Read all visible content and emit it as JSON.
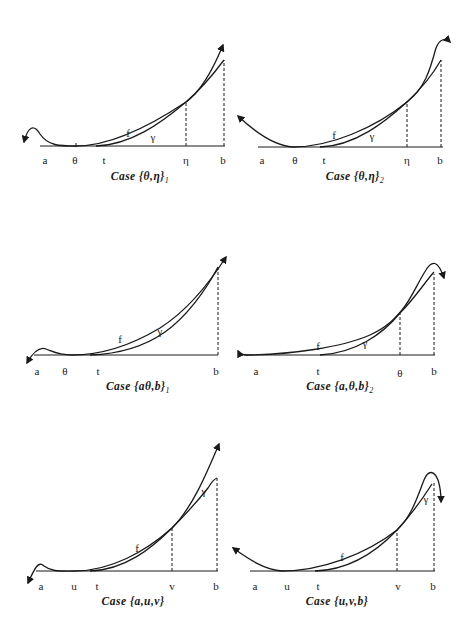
{
  "figure": {
    "panels": [
      {
        "id": "theta-eta-1",
        "caption": "Case {θ,η}",
        "caption_subscript": "1",
        "axis_labels": [
          "a",
          "θ",
          "t",
          "η",
          "b"
        ],
        "curve_labels": {
          "f": "f",
          "gamma": "γ"
        }
      },
      {
        "id": "theta-eta-2",
        "caption": "Case {θ,η}",
        "caption_subscript": "2",
        "axis_labels": [
          "a",
          "θ",
          "t",
          "η",
          "b"
        ],
        "curve_labels": {
          "f": "f",
          "gamma": "γ"
        }
      },
      {
        "id": "a-theta-b-1",
        "caption": "Case {aθ,b}",
        "caption_subscript": "1",
        "axis_labels": [
          "a",
          "θ",
          "t",
          "b"
        ],
        "curve_labels": {
          "f": "f",
          "gamma": "γ"
        }
      },
      {
        "id": "a-theta-b-2",
        "caption": "Case {a,θ,b}",
        "caption_subscript": "2",
        "axis_labels": [
          "a",
          "t",
          "θ",
          "b"
        ],
        "curve_labels": {
          "f": "f",
          "gamma": "γ"
        }
      },
      {
        "id": "a-u-v",
        "caption": "Case {a,u,v}",
        "caption_subscript": "",
        "axis_labels": [
          "a",
          "u",
          "t",
          "v",
          "b"
        ],
        "curve_labels": {
          "f": "f",
          "gamma": "γ"
        }
      },
      {
        "id": "u-v-b",
        "caption": "Case {u,v,b}",
        "caption_subscript": "",
        "axis_labels": [
          "a",
          "u",
          "t",
          "v",
          "b"
        ],
        "curve_labels": {
          "f": "f",
          "gamma": "γ"
        }
      }
    ]
  },
  "colors": {
    "ink": "#1a1a1a",
    "background": "#ffffff"
  }
}
